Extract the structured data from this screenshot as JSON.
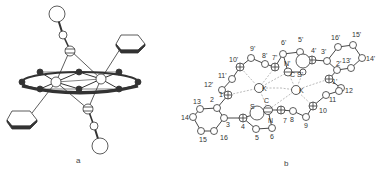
{
  "figure": {
    "panel_a": {
      "caption": "a"
    },
    "panel_b": {
      "caption": "b",
      "atom_labels": {
        "l_10p": "10'",
        "l_9p": "9'",
        "l_8p": "8'",
        "l_7p": "7'",
        "l_6p": "6'",
        "l_5p": "5'",
        "l_4p": "4'",
        "l_3p": "3'",
        "l_16p": "16'",
        "l_15p": "15'",
        "l_14p": "14'",
        "l_13p": "13'",
        "l_2p": "2'",
        "l_1p": "1'",
        "l_11p": "11'",
        "l_12p": "12'",
        "l_Np": "N'",
        "l_Cp": "C",
        "l_Sp": "S'",
        "l_K1": "K",
        "l_K2": "K",
        "l_1": "1",
        "l_2": "2",
        "l_3": "3",
        "l_4": "4",
        "l_5": "5",
        "l_6": "6",
        "l_7": "7",
        "l_8": "8",
        "l_9": "9",
        "l_10": "10",
        "l_11": "11",
        "l_12": "12",
        "l_13": "13",
        "l_14": "14",
        "l_15": "15",
        "l_16": "16",
        "l_N": "N",
        "l_S": "S",
        "l_C": "C"
      }
    }
  }
}
